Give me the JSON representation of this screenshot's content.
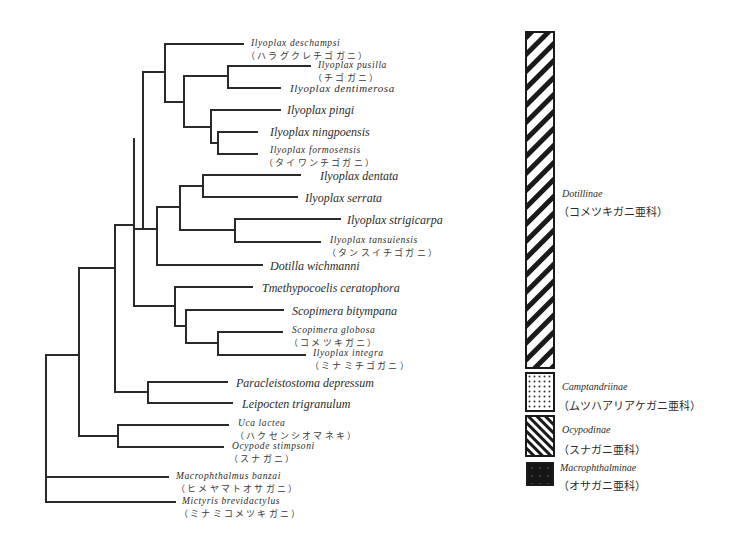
{
  "taxa": [
    {
      "name": "Ilyoplax deschampsi",
      "jp": "（ハラグクレチゴガニ）"
    },
    {
      "name": "Ilyoplax pusilla",
      "jp": "（チゴガニ）"
    },
    {
      "name": "Ilyoplax dentimerosa",
      "jp": ""
    },
    {
      "name": "Ilyoplax pingi",
      "jp": ""
    },
    {
      "name": "Ilyoplax ningpoensis",
      "jp": ""
    },
    {
      "name": "Ilyoplax formosensis",
      "jp": "（タイワンチゴガニ）"
    },
    {
      "name": "Ilyoplax dentata",
      "jp": ""
    },
    {
      "name": "Ilyoplax serrata",
      "jp": ""
    },
    {
      "name": "Ilyoplax strigicarpa",
      "jp": ""
    },
    {
      "name": "Ilyoplax tansuiensis",
      "jp": "（タンスイチゴガニ）"
    },
    {
      "name": "Dotilla wichmanni",
      "jp": ""
    },
    {
      "name": "Tmethypocoelis ceratophora",
      "jp": ""
    },
    {
      "name": "Scopimera bitympana",
      "jp": ""
    },
    {
      "name": "Scopimera globosa",
      "jp": "（コメツキガニ）"
    },
    {
      "name": "Ilyoplax integra",
      "jp": "（ミナミチゴガニ）"
    },
    {
      "name": "Paracleistostoma depressum",
      "jp": ""
    },
    {
      "name": "Leipocten trigranulum",
      "jp": ""
    },
    {
      "name": "Uca lactea",
      "jp": "（ハクセンシオマネキ）"
    },
    {
      "name": "Ocypode stimpsoni",
      "jp": "（スナガニ）"
    },
    {
      "name": "Macrophthalmus banzai",
      "jp": "（ヒメヤマトオサガニ）"
    },
    {
      "name": "Mictyris brevidactylus",
      "jp": "（ミナミコメツキガニ）"
    }
  ],
  "legend": [
    {
      "name": "Dotillinae",
      "jp": "（コメツキガニ亜科）",
      "pattern": "diagonal-wide"
    },
    {
      "name": "Camptandriinae",
      "jp": "（ムツハアリアケガニ亜科）",
      "pattern": "dotted"
    },
    {
      "name": "Ocypodinae",
      "jp": "（スナガニ亜科）",
      "pattern": "diagonal-dense"
    },
    {
      "name": "Macrophthalminae",
      "jp": "（オサガニ亜科）",
      "pattern": "black-speckled"
    }
  ],
  "colors": {
    "line": "#2a2a2a",
    "background": "#ffffff"
  }
}
